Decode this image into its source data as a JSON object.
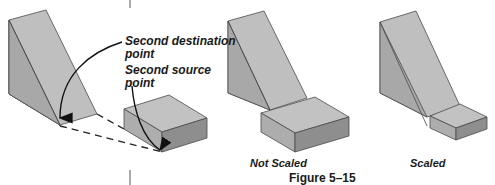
{
  "figure": {
    "caption": "Figure 5–15",
    "panels": [
      {
        "id": "before",
        "callouts": [
          {
            "line1": "Second destination",
            "line2": "point"
          },
          {
            "line1": "Second source",
            "line2": "point"
          }
        ]
      },
      {
        "id": "not-scaled",
        "label": "Not Scaled"
      },
      {
        "id": "scaled",
        "label": "Scaled"
      }
    ]
  },
  "colors": {
    "face_light": "#c2c2c2",
    "face_mid": "#acacac",
    "face_dark": "#8f8f8f",
    "edge": "#4a4a4a",
    "text": "#1a1a1a"
  }
}
